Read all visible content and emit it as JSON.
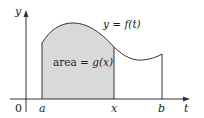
{
  "figure": {
    "note": "No axis ticks or scale are shown; coordinates are pixel estimates of the rendered geometry, not data values.",
    "colors": {
      "axis": "#333333",
      "curve": "#333333",
      "shaded_area": "#d9d9d9",
      "background": "#ffffff",
      "text": "#222222"
    },
    "labels": {
      "origin": "0",
      "y_axis": "y",
      "t_axis": "t",
      "a": "a",
      "x": "x",
      "b": "b",
      "curve_label": "y = f(t)",
      "area_label_prefix": "area = ",
      "area_label_func": "g(x)"
    },
    "geometry_px_estimates": {
      "baseline_y": 99,
      "y_axis_x": 26,
      "a_x": 42,
      "x_x": 114,
      "b_x": 162,
      "curve_points": [
        [
          42,
          43
        ],
        [
          73,
          23
        ],
        [
          114,
          47
        ],
        [
          143,
          60
        ],
        [
          162,
          54
        ]
      ]
    }
  }
}
